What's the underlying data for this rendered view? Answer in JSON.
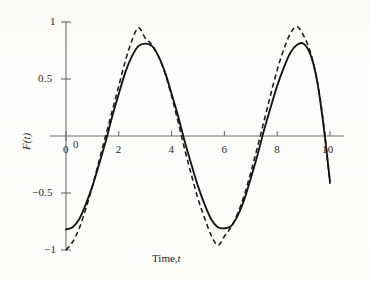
{
  "figure": {
    "name": "fourier-sine-approximation-plot",
    "background_color": "#fdfdfd",
    "axis_color": "#6e6e6e",
    "curve_color": "#141414"
  },
  "axes": {
    "x_title_main": "Time,",
    "x_title_symbol": "t",
    "y_title": "F(t)",
    "x_tick_labels": [
      "0",
      "2",
      "4",
      "6",
      "8",
      "10"
    ],
    "y_tick_labels": [
      "1",
      "0.5",
      "0",
      "−0.5",
      "−1"
    ]
  },
  "chart_data": {
    "type": "line",
    "title": "",
    "xlabel": "Time, t",
    "ylabel": "F(t)",
    "xlim": [
      -0.6,
      10.4
    ],
    "ylim": [
      -1.05,
      1.05
    ],
    "xticks": [
      0,
      2,
      4,
      6,
      8,
      10
    ],
    "yticks": [
      -1,
      -0.5,
      0,
      0.5,
      1
    ],
    "grid": false,
    "legend": "none",
    "x_axis_position": "zero",
    "series": [
      {
        "name": "solid-curve",
        "style": "solid",
        "amplitude": 0.81,
        "period": 5.0,
        "phase_zero_crossing_rising": 1.2,
        "x": [
          0.0,
          0.25,
          0.5,
          0.75,
          1.0,
          1.25,
          1.5,
          1.75,
          2.0,
          2.25,
          2.5,
          2.75,
          3.0,
          3.25,
          3.5,
          3.75,
          4.0,
          4.25,
          4.5,
          4.75,
          5.0,
          5.25,
          5.5,
          5.75,
          6.0,
          6.25,
          6.5,
          6.75,
          7.0,
          7.25,
          7.5,
          7.75,
          8.0,
          8.25,
          8.5,
          8.75,
          9.0,
          9.25,
          9.5,
          9.75,
          10.0
        ],
        "y": [
          -0.82,
          -0.8,
          -0.73,
          -0.6,
          -0.44,
          -0.25,
          -0.05,
          0.17,
          0.37,
          0.56,
          0.7,
          0.79,
          0.81,
          0.79,
          0.7,
          0.56,
          0.37,
          0.17,
          -0.05,
          -0.25,
          -0.44,
          -0.6,
          -0.73,
          -0.8,
          -0.81,
          -0.79,
          -0.7,
          -0.56,
          -0.37,
          -0.17,
          0.05,
          0.25,
          0.44,
          0.6,
          0.73,
          0.8,
          0.81,
          0.72,
          0.5,
          0.1,
          -0.4
        ]
      },
      {
        "name": "dashed-curve",
        "style": "dashed",
        "amplitude": 0.95,
        "period": 5.0,
        "phase_zero_crossing_rising": 1.25,
        "x": [
          0.0,
          0.25,
          0.5,
          0.75,
          1.0,
          1.25,
          1.5,
          1.75,
          2.0,
          2.25,
          2.5,
          2.75,
          3.0,
          3.25,
          3.5,
          3.75,
          4.0,
          4.25,
          4.5,
          4.75,
          5.0,
          5.25,
          5.5,
          5.75,
          6.0,
          6.25,
          6.5,
          6.75,
          7.0,
          7.25,
          7.5,
          7.75,
          8.0,
          8.25,
          8.5,
          8.75,
          9.0,
          9.25,
          9.5,
          9.75,
          10.0
        ],
        "y": [
          -1.0,
          -0.93,
          -0.81,
          -0.64,
          -0.44,
          -0.22,
          0.0,
          0.22,
          0.44,
          0.66,
          0.84,
          0.95,
          0.86,
          0.8,
          0.7,
          0.55,
          0.35,
          0.12,
          -0.12,
          -0.34,
          -0.55,
          -0.72,
          -0.87,
          -0.96,
          -0.88,
          -0.8,
          -0.68,
          -0.52,
          -0.32,
          -0.1,
          0.13,
          0.36,
          0.58,
          0.76,
          0.9,
          0.96,
          0.88,
          0.74,
          0.5,
          0.12,
          -0.42
        ]
      }
    ],
    "annotations": [
      {
        "text": "peaks of dashed curve overshoot to approximately +0.95 / -0.96"
      },
      {
        "text": "solid curve peaks at approximately +0.81 / -0.81"
      }
    ]
  }
}
